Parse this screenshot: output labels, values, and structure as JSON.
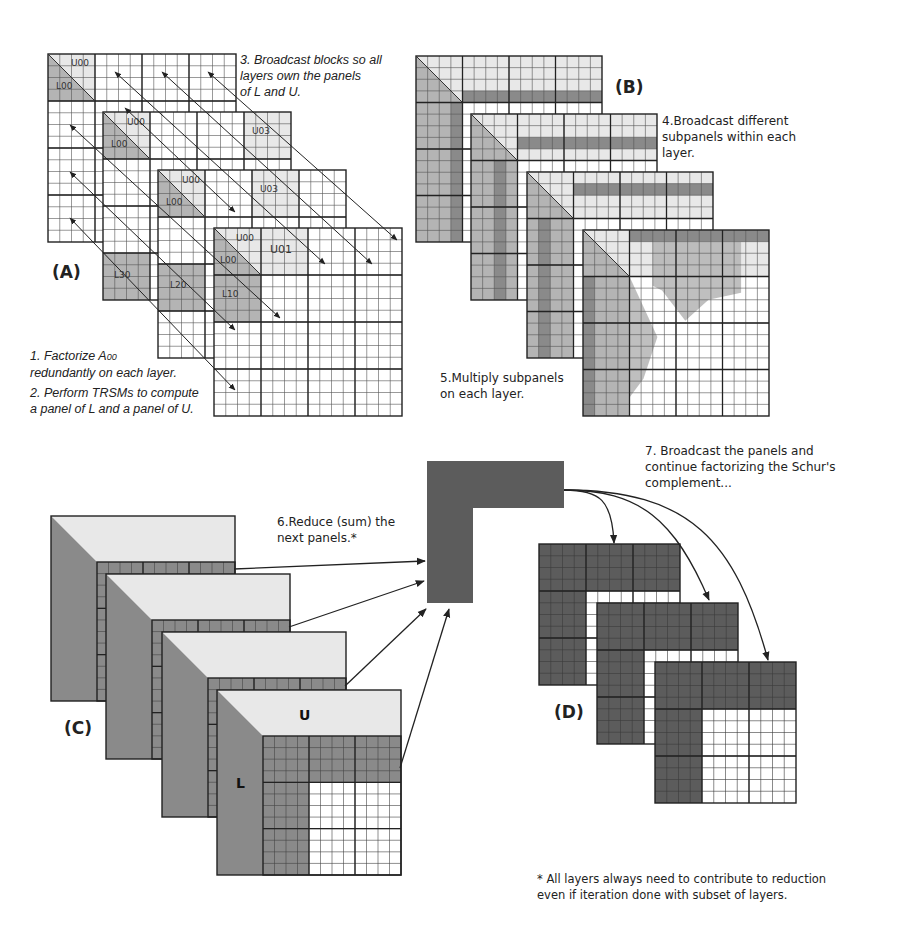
{
  "figure": {
    "panels": {
      "A": {
        "tag": "(A)",
        "step1_line1": "1. Factorize A",
        "step1_sub": "00",
        "step1_line2": "redundantly on each layer.",
        "step2_line1": "2. Perform TRSMs to compute",
        "step2_line2": "a panel of L and a panel of U.",
        "step3_line1": "3. Broadcast blocks so all",
        "step3_line2": "layers own the panels",
        "step3_line3": "of L and U.",
        "block_labels": {
          "U00": "U00",
          "L00": "L00",
          "U01": "U01",
          "U03": "U03",
          "U02": "U03",
          "L10": "L10",
          "L20": "L20",
          "L30": "L30"
        },
        "layers": 4,
        "blocks_per_side": 4,
        "cells_per_block": 4
      },
      "B": {
        "tag": "(B)",
        "step4_line1": "4.Broadcast different",
        "step4_line2": "subpanels within each",
        "step4_line3": "layer.",
        "step5_line1": "5.Multiply subpanels",
        "step5_line2": "on each layer.",
        "layers": 4
      },
      "C": {
        "tag": "(C)",
        "step6_line1": "6.Reduce (sum) the",
        "step6_line2": "next panels.*",
        "label_U": "U",
        "label_L": "L",
        "layers": 4
      },
      "D": {
        "tag": "(D)",
        "step7_line1": "7. Broadcast the panels and",
        "step7_line2": "continue factorizing the Schur's",
        "step7_line3": "complement...",
        "layers": 3
      }
    },
    "footnote_line1": "* All layers always need to contribute to reduction",
    "footnote_line2": "even if iteration done with subset of layers.",
    "colors": {
      "grid_line": "#333333",
      "light_fill": "#e8e8e8",
      "mid_fill": "#b4b4b4",
      "dark_fill": "#8a8a8a",
      "darker_fill": "#6a6a6a",
      "panel_dark": "#5c5c5c"
    }
  }
}
